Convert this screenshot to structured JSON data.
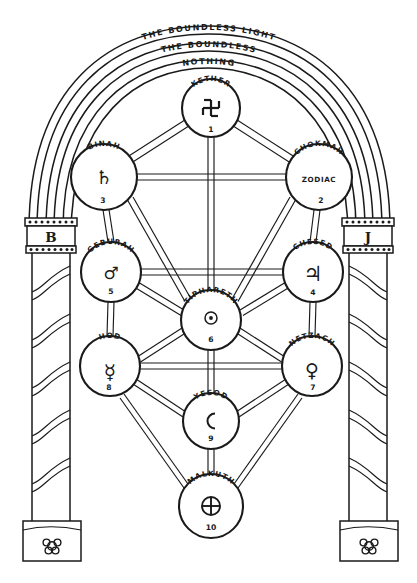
{
  "arcs": [
    {
      "id": "arc-outer",
      "label": "THE BOUNDLESS LIGHT"
    },
    {
      "id": "arc-middle",
      "label": "THE BOUNDLESS"
    },
    {
      "id": "arc-inner",
      "label": "NOTHING"
    }
  ],
  "pillars": {
    "left": {
      "label": "B",
      "name": "boaz",
      "ornament": "rosette-icon"
    },
    "right": {
      "label": "J",
      "name": "jachin",
      "ornament": "rosette-icon"
    }
  },
  "sefirot": [
    {
      "key": "kether",
      "name": "KETHER",
      "number": "1",
      "symbol": "fylfot-icon",
      "sub": ""
    },
    {
      "key": "chokmah",
      "name": "CHOKMAH",
      "number": "2",
      "symbol": "",
      "sub": "ZODIAC"
    },
    {
      "key": "binah",
      "name": "BINAH",
      "number": "3",
      "symbol": "saturn-icon",
      "sub": ""
    },
    {
      "key": "chesed",
      "name": "CHESED",
      "number": "4",
      "symbol": "jupiter-icon",
      "sub": ""
    },
    {
      "key": "geburah",
      "name": "GEBURAH",
      "number": "5",
      "symbol": "mars-icon",
      "sub": ""
    },
    {
      "key": "tiphareth",
      "name": "TIPHARETH",
      "number": "6",
      "symbol": "sun-icon",
      "sub": ""
    },
    {
      "key": "netzach",
      "name": "NETZACH",
      "number": "7",
      "symbol": "venus-icon",
      "sub": ""
    },
    {
      "key": "hod",
      "name": "HOD",
      "number": "8",
      "symbol": "mercury-icon",
      "sub": ""
    },
    {
      "key": "yesod",
      "name": "YESOD",
      "number": "9",
      "symbol": "moon-icon",
      "sub": ""
    },
    {
      "key": "malkuth",
      "name": "MALKUTH",
      "number": "10",
      "symbol": "earth-icon",
      "sub": ""
    }
  ],
  "colors": {
    "ink": "#1a1a1a",
    "paper": "#ffffff"
  }
}
